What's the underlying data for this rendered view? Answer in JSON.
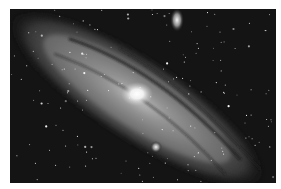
{
  "image": {
    "subject": "Andromeda galaxy (spiral galaxy) with two satellite galaxies in a star field",
    "color_mode": "grayscale",
    "background_color": "#ffffff",
    "sky_color": "#141414",
    "features": [
      {
        "name": "galaxy-core",
        "description": "bright central nucleus"
      },
      {
        "name": "galaxy-disk",
        "description": "tilted elliptical disk with dark dust lanes running diagonally from upper-left to lower-right"
      },
      {
        "name": "satellite-galaxy-upper",
        "description": "small elongated fuzzy companion near top"
      },
      {
        "name": "satellite-galaxy-lower",
        "description": "compact bright companion below the core"
      },
      {
        "name": "star-field",
        "description": "scattered foreground stars"
      }
    ]
  }
}
